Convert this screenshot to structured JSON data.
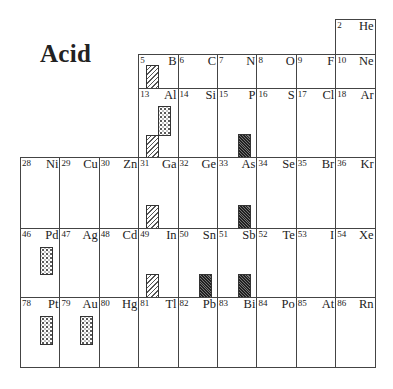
{
  "title": "Acid",
  "legend_patterns": {
    "hatch": "diagonal-hatched bar",
    "dots": "dotted bar",
    "dark": "dark dense-hatched bar"
  },
  "elements": [
    {
      "num": "2",
      "sym": "He",
      "col": 8,
      "row": 0,
      "bars": []
    },
    {
      "num": "5",
      "sym": "B",
      "col": 3,
      "row": 1,
      "bars": [
        {
          "type": "hatch",
          "x": 7,
          "y": 10,
          "w": 13,
          "h": 24
        }
      ]
    },
    {
      "num": "6",
      "sym": "C",
      "col": 4,
      "row": 1,
      "bars": []
    },
    {
      "num": "7",
      "sym": "N",
      "col": 5,
      "row": 1,
      "bars": []
    },
    {
      "num": "8",
      "sym": "O",
      "col": 6,
      "row": 1,
      "bars": []
    },
    {
      "num": "9",
      "sym": "F",
      "col": 7,
      "row": 1,
      "bars": []
    },
    {
      "num": "10",
      "sym": "Ne",
      "col": 8,
      "row": 1,
      "bars": []
    },
    {
      "num": "13",
      "sym": "Al",
      "col": 3,
      "row": 2,
      "bars": [
        {
          "type": "dots",
          "x": 19,
          "y": 17,
          "w": 13,
          "h": 30
        },
        {
          "type": "hatch",
          "x": 7,
          "y": 46,
          "w": 13,
          "h": 23
        }
      ]
    },
    {
      "num": "14",
      "sym": "Si",
      "col": 4,
      "row": 2,
      "bars": []
    },
    {
      "num": "15",
      "sym": "P",
      "col": 5,
      "row": 2,
      "bars": [
        {
          "type": "dark",
          "x": 20,
          "y": 45,
          "w": 13,
          "h": 24
        }
      ]
    },
    {
      "num": "16",
      "sym": "S",
      "col": 6,
      "row": 2,
      "bars": []
    },
    {
      "num": "17",
      "sym": "Cl",
      "col": 7,
      "row": 2,
      "bars": []
    },
    {
      "num": "18",
      "sym": "Ar",
      "col": 8,
      "row": 2,
      "bars": []
    },
    {
      "num": "28",
      "sym": "Ni",
      "col": 0,
      "row": 3,
      "bars": []
    },
    {
      "num": "29",
      "sym": "Cu",
      "col": 1,
      "row": 3,
      "bars": []
    },
    {
      "num": "30",
      "sym": "Zn",
      "col": 2,
      "row": 3,
      "bars": []
    },
    {
      "num": "31",
      "sym": "Ga",
      "col": 3,
      "row": 3,
      "bars": [
        {
          "type": "hatch",
          "x": 7,
          "y": 47,
          "w": 13,
          "h": 24
        }
      ]
    },
    {
      "num": "32",
      "sym": "Ge",
      "col": 4,
      "row": 3,
      "bars": []
    },
    {
      "num": "33",
      "sym": "As",
      "col": 5,
      "row": 3,
      "bars": [
        {
          "type": "dark",
          "x": 20,
          "y": 47,
          "w": 13,
          "h": 24
        }
      ]
    },
    {
      "num": "34",
      "sym": "Se",
      "col": 6,
      "row": 3,
      "bars": []
    },
    {
      "num": "35",
      "sym": "Br",
      "col": 7,
      "row": 3,
      "bars": []
    },
    {
      "num": "36",
      "sym": "Kr",
      "col": 8,
      "row": 3,
      "bars": []
    },
    {
      "num": "46",
      "sym": "Pd",
      "col": 0,
      "row": 4,
      "bars": [
        {
          "type": "dots",
          "x": 19,
          "y": 18,
          "w": 13,
          "h": 28
        }
      ]
    },
    {
      "num": "47",
      "sym": "Ag",
      "col": 1,
      "row": 4,
      "bars": []
    },
    {
      "num": "48",
      "sym": "Cd",
      "col": 2,
      "row": 4,
      "bars": []
    },
    {
      "num": "49",
      "sym": "In",
      "col": 3,
      "row": 4,
      "bars": [
        {
          "type": "hatch",
          "x": 7,
          "y": 45,
          "w": 13,
          "h": 24
        }
      ]
    },
    {
      "num": "50",
      "sym": "Sn",
      "col": 4,
      "row": 4,
      "bars": [
        {
          "type": "dark",
          "x": 20,
          "y": 45,
          "w": 13,
          "h": 24
        }
      ]
    },
    {
      "num": "51",
      "sym": "Sb",
      "col": 5,
      "row": 4,
      "bars": [
        {
          "type": "dark",
          "x": 20,
          "y": 45,
          "w": 13,
          "h": 24
        }
      ]
    },
    {
      "num": "52",
      "sym": "Te",
      "col": 6,
      "row": 4,
      "bars": []
    },
    {
      "num": "53",
      "sym": "I",
      "col": 7,
      "row": 4,
      "bars": []
    },
    {
      "num": "54",
      "sym": "Xe",
      "col": 8,
      "row": 4,
      "bars": []
    },
    {
      "num": "78",
      "sym": "Pt",
      "col": 0,
      "row": 5,
      "bars": [
        {
          "type": "dots",
          "x": 19,
          "y": 18,
          "w": 13,
          "h": 29
        }
      ]
    },
    {
      "num": "79",
      "sym": "Au",
      "col": 1,
      "row": 5,
      "bars": [
        {
          "type": "dots",
          "x": 20,
          "y": 18,
          "w": 13,
          "h": 29
        }
      ]
    },
    {
      "num": "80",
      "sym": "Hg",
      "col": 2,
      "row": 5,
      "bars": []
    },
    {
      "num": "81",
      "sym": "Tl",
      "col": 3,
      "row": 5,
      "bars": []
    },
    {
      "num": "82",
      "sym": "Pb",
      "col": 4,
      "row": 5,
      "bars": []
    },
    {
      "num": "83",
      "sym": "Bi",
      "col": 5,
      "row": 5,
      "bars": []
    },
    {
      "num": "84",
      "sym": "Po",
      "col": 6,
      "row": 5,
      "bars": []
    },
    {
      "num": "85",
      "sym": "At",
      "col": 7,
      "row": 5,
      "bars": []
    },
    {
      "num": "86",
      "sym": "Rn",
      "col": 8,
      "row": 5,
      "bars": []
    }
  ],
  "extra_bars_above_row_boundary": [
    {
      "cell_sym": "Tl",
      "note": "hatched bar at bottom of In cell belongs to In (row 4)"
    },
    {
      "cell_sym": "Pb",
      "note": "dark bar at bottom of Sn cell belongs to Sn (row 4)"
    },
    {
      "cell_sym": "Bi",
      "note": "dark bar at bottom of Sb cell belongs to Sb (row 4)"
    }
  ]
}
